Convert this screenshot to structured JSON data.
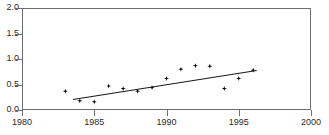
{
  "chart_data": {
    "type": "scatter",
    "title": "",
    "xlabel": "",
    "ylabel": "",
    "xlim": [
      1980,
      2000
    ],
    "ylim": [
      0.0,
      2.0
    ],
    "xticks": [
      1980,
      1985,
      1990,
      1995,
      2000
    ],
    "xtick_labels": [
      "1980",
      "1985",
      "1990",
      "1995",
      "2000"
    ],
    "yticks": [
      0.0,
      0.5,
      1.0,
      1.5,
      2.0
    ],
    "ytick_labels": [
      "0.0",
      "0.5",
      "1.0",
      "1.5",
      "2.0"
    ],
    "grid": false,
    "legend": null,
    "series": [
      {
        "name": "observations",
        "marker": "diamond",
        "color": "#000000",
        "x": [
          1983,
          1984,
          1985,
          1986,
          1987,
          1988,
          1989,
          1990,
          1991,
          1992,
          1993,
          1994,
          1995,
          1996
        ],
        "values": [
          0.37,
          0.18,
          0.16,
          0.47,
          0.42,
          0.37,
          0.44,
          0.62,
          0.8,
          0.87,
          0.86,
          0.42,
          0.62,
          0.78
        ]
      },
      {
        "name": "linear-trend",
        "type": "line",
        "color": "#1a1a1a",
        "x": [
          1983.5,
          1996.2
        ],
        "values": [
          0.22,
          0.79
        ]
      }
    ]
  },
  "axis": {
    "x_tick_positions_px": [
      22,
      94.3,
      166.5,
      238.8,
      311
    ],
    "y_tick_positions_px": [
      110,
      84.5,
      59,
      33.5,
      8
    ]
  },
  "clipped_header": {
    "text": ""
  }
}
